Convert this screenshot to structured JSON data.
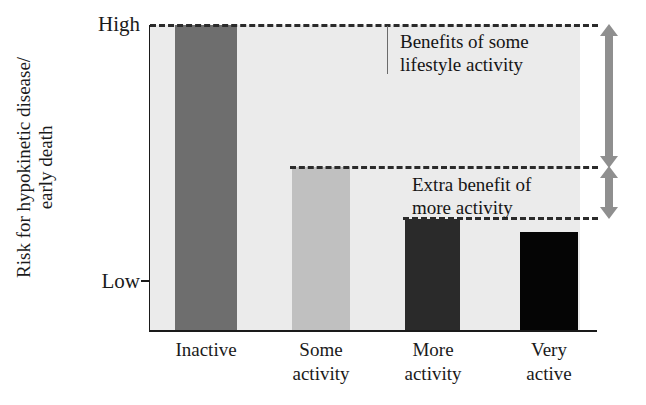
{
  "chart_data": {
    "type": "bar",
    "title": "",
    "xlabel": "",
    "ylabel_line1": "Risk for hypokinetic disease/",
    "ylabel_line2": "early death",
    "categories": [
      "Inactive",
      "Some activity",
      "More activity",
      "Very active"
    ],
    "category_lines": [
      [
        "Inactive"
      ],
      [
        "Some",
        "activity"
      ],
      [
        "More",
        "activity"
      ],
      [
        "Very",
        "active"
      ]
    ],
    "values": [
      100,
      53.5,
      36.5,
      32
    ],
    "ylim": [
      0,
      100
    ],
    "ytick_labels": [
      "High",
      "Low"
    ],
    "ytick_values": [
      100,
      16
    ],
    "grid": false,
    "legend": "none",
    "bar_colors": [
      "#6e6e6e",
      "#c0c0c0",
      "#2a2a2a",
      "#050505"
    ],
    "plot_background": "#ebebeb",
    "annotations": [
      {
        "name": "benefits-of-some-lifestyle-activity",
        "line1": "Benefits of some",
        "line2": "lifestyle activity",
        "from_value": 100,
        "to_value": 53.5
      },
      {
        "name": "extra-benefit-of-more-activity",
        "line1": "Extra benefit of",
        "line2": "more activity",
        "from_value": 53.5,
        "to_value": 36.5
      }
    ],
    "reference_lines": [
      100,
      53.5,
      36.5
    ],
    "arrow_color": "#8f8f8f",
    "dash_color": "#2b2b2b"
  }
}
